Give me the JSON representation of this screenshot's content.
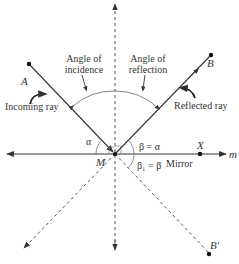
{
  "diagram": {
    "points": {
      "A": "A",
      "B": "B",
      "B_prime": "B'",
      "M": "M",
      "X": "X",
      "m": "m"
    },
    "labels": {
      "incidence_line1": "Angle of",
      "incidence_line2": "incidence",
      "reflection_line1": "Angle of",
      "reflection_line2": "reflection",
      "incoming_ray": "Incoming ray",
      "reflected_ray": "Reflected ray",
      "mirror": "Mirror",
      "alpha": "α",
      "beta_eq_alpha": "β = α",
      "beta1_eq_beta": "β₁ = β"
    },
    "colors": {
      "line": "#333333",
      "dashed": "#555555",
      "arc": "#777777"
    }
  }
}
